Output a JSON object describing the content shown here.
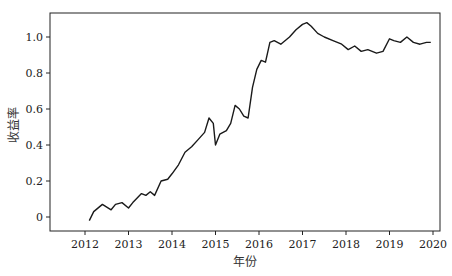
{
  "chart_data": {
    "type": "line",
    "title": "",
    "xlabel": "年份",
    "ylabel": "收益率",
    "xlim": [
      2011.0,
      2020.2
    ],
    "ylim": [
      -0.08,
      1.12
    ],
    "x_ticks": [
      2012,
      2013,
      2014,
      2015,
      2016,
      2017,
      2018,
      2019,
      2020
    ],
    "x_tick_labels": [
      "2012",
      "2013",
      "2014",
      "2015",
      "2016",
      "2017",
      "2018",
      "2019",
      "2020"
    ],
    "y_ticks": [
      0,
      0.2,
      0.4,
      0.6,
      0.8,
      1.0
    ],
    "y_tick_labels": [
      "0",
      "0.2",
      "0.4",
      "0.6",
      "0.8",
      "1.0"
    ],
    "grid": false,
    "legend": null,
    "series": [
      {
        "name": "收益率",
        "color": "#1a1a1a",
        "x": [
          2012.1,
          2012.2,
          2012.4,
          2012.6,
          2012.7,
          2012.85,
          2013.0,
          2013.1,
          2013.3,
          2013.4,
          2013.5,
          2013.6,
          2013.75,
          2013.9,
          2014.0,
          2014.15,
          2014.3,
          2014.45,
          2014.6,
          2014.75,
          2014.85,
          2014.95,
          2015.0,
          2015.1,
          2015.25,
          2015.35,
          2015.45,
          2015.55,
          2015.65,
          2015.75,
          2015.85,
          2015.95,
          2016.05,
          2016.15,
          2016.25,
          2016.35,
          2016.5,
          2016.7,
          2016.85,
          2017.0,
          2017.1,
          2017.2,
          2017.35,
          2017.5,
          2017.7,
          2017.9,
          2018.05,
          2018.2,
          2018.35,
          2018.5,
          2018.7,
          2018.85,
          2019.0,
          2019.1,
          2019.25,
          2019.4,
          2019.55,
          2019.7,
          2019.85,
          2019.95
        ],
        "values": [
          -0.02,
          0.03,
          0.07,
          0.04,
          0.07,
          0.08,
          0.05,
          0.08,
          0.13,
          0.12,
          0.14,
          0.12,
          0.2,
          0.21,
          0.24,
          0.29,
          0.36,
          0.39,
          0.43,
          0.47,
          0.55,
          0.52,
          0.4,
          0.46,
          0.48,
          0.52,
          0.62,
          0.6,
          0.56,
          0.55,
          0.72,
          0.82,
          0.87,
          0.86,
          0.97,
          0.98,
          0.96,
          1.0,
          1.04,
          1.07,
          1.08,
          1.06,
          1.02,
          1.0,
          0.98,
          0.96,
          0.93,
          0.95,
          0.92,
          0.93,
          0.91,
          0.92,
          0.99,
          0.98,
          0.97,
          1.0,
          0.97,
          0.96,
          0.97,
          0.97
        ]
      }
    ]
  }
}
